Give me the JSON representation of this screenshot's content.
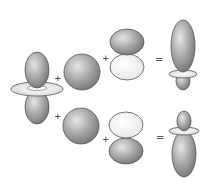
{
  "diagram": {
    "type": "orbital-hybridization-equation",
    "colors": {
      "dark_lobe": "#8a8a8a",
      "light_lobe": "#f2f2f2",
      "outline": "#555555",
      "background": "#ffffff"
    },
    "operators": {
      "plus": "+",
      "equals": "="
    },
    "rows": [
      {
        "terms": [
          "d-orbital (dz2)",
          "s-orbital (sphere)",
          "p-orbital (dark up)"
        ],
        "result": "hybrid orbital (large lobe up)"
      },
      {
        "terms": [
          "d-orbital (dz2)",
          "s-orbital (sphere)",
          "p-orbital (dark down)"
        ],
        "result": "hybrid orbital (large lobe down)"
      }
    ]
  }
}
